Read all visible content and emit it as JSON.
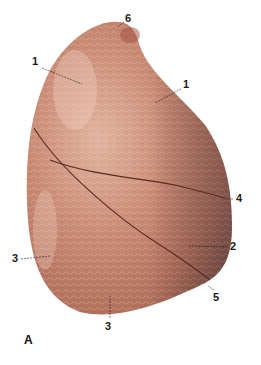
{
  "figure": {
    "panel_letter": "A",
    "colors": {
      "tissue_light": "#d9a08a",
      "tissue_mid": "#c07a66",
      "tissue_dark": "#9a5848",
      "shadow": "#6e4a4a",
      "fissure": "#5a2a22",
      "background": "#ffffff"
    },
    "labels": [
      {
        "id": "1a",
        "text": "1",
        "x": 32,
        "y": 62
      },
      {
        "id": "1b",
        "text": "1",
        "x": 183,
        "y": 83
      },
      {
        "id": "6",
        "text": "6",
        "x": 125,
        "y": 17
      },
      {
        "id": "4",
        "text": "4",
        "x": 236,
        "y": 195
      },
      {
        "id": "2",
        "text": "2",
        "x": 230,
        "y": 243
      },
      {
        "id": "3a",
        "text": "3",
        "x": 12,
        "y": 255
      },
      {
        "id": "3b",
        "text": "3",
        "x": 105,
        "y": 321
      },
      {
        "id": "5",
        "text": "5",
        "x": 212,
        "y": 292
      }
    ]
  }
}
